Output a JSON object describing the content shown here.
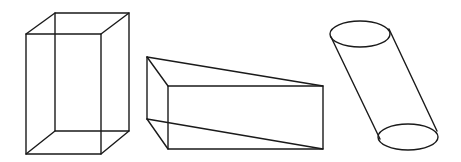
{
  "figure": {
    "width": 461,
    "height": 162,
    "background": "#ffffff",
    "stroke_color": "#1a1a1a",
    "shapes": [
      {
        "name": "rectangular-prism",
        "type": "wireframe-box",
        "front_face": {
          "x1": 26,
          "y1": 34,
          "x2": 101,
          "y2": 154
        },
        "back_face": {
          "x1": 55,
          "y1": 13,
          "x2": 129,
          "y2": 131
        }
      },
      {
        "name": "triangular-prism",
        "type": "wireframe-wedge",
        "back_top_left": [
          147,
          57
        ],
        "back_bottom_left": [
          147,
          119
        ],
        "front_face": {
          "x1": 168,
          "y1": 86,
          "x2": 323,
          "y2": 149
        }
      },
      {
        "name": "oblique-cylinder",
        "type": "wireframe-cylinder",
        "top_ellipse": {
          "cx": 360,
          "cy": 34,
          "rx": 30,
          "ry": 13
        },
        "bottom_ellipse": {
          "cx": 408,
          "cy": 137,
          "rx": 30,
          "ry": 13
        },
        "left_side": [
          [
            331,
            37
          ],
          [
            380,
            139
          ]
        ],
        "right_side": [
          [
            389,
            29
          ],
          [
            437,
            131
          ]
        ]
      }
    ]
  }
}
